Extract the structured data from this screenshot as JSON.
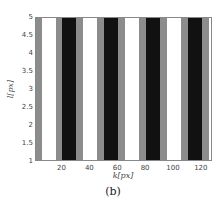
{
  "chart_data": {
    "type": "heatmap",
    "title": "",
    "caption": "(b)",
    "xlabel": "k[px]",
    "ylabel": "l[px]",
    "xlim": [
      1,
      128
    ],
    "ylim": [
      1,
      5
    ],
    "xticks": [
      20,
      40,
      60,
      80,
      100,
      120
    ],
    "yticks": [
      1,
      1.5,
      2,
      2.5,
      3,
      3.5,
      4,
      4.5,
      5
    ],
    "colors": {
      "white": "#ffffff",
      "gray": "#8c8c8c",
      "black": "#111111"
    },
    "stripes": [
      {
        "x0": 1,
        "x1": 5,
        "value": "gray"
      },
      {
        "x0": 5,
        "x1": 15,
        "value": "white"
      },
      {
        "x0": 15,
        "x1": 20,
        "value": "gray"
      },
      {
        "x0": 20,
        "x1": 30,
        "value": "black"
      },
      {
        "x0": 30,
        "x1": 35,
        "value": "gray"
      },
      {
        "x0": 35,
        "x1": 45,
        "value": "white"
      },
      {
        "x0": 45,
        "x1": 50,
        "value": "gray"
      },
      {
        "x0": 50,
        "x1": 60,
        "value": "black"
      },
      {
        "x0": 60,
        "x1": 65,
        "value": "gray"
      },
      {
        "x0": 65,
        "x1": 75,
        "value": "white"
      },
      {
        "x0": 75,
        "x1": 80,
        "value": "gray"
      },
      {
        "x0": 80,
        "x1": 90,
        "value": "black"
      },
      {
        "x0": 90,
        "x1": 95,
        "value": "gray"
      },
      {
        "x0": 95,
        "x1": 105,
        "value": "white"
      },
      {
        "x0": 105,
        "x1": 110,
        "value": "gray"
      },
      {
        "x0": 110,
        "x1": 120,
        "value": "black"
      },
      {
        "x0": 120,
        "x1": 125,
        "value": "gray"
      },
      {
        "x0": 125,
        "x1": 128,
        "value": "white"
      }
    ],
    "grid": false,
    "legend": null
  }
}
